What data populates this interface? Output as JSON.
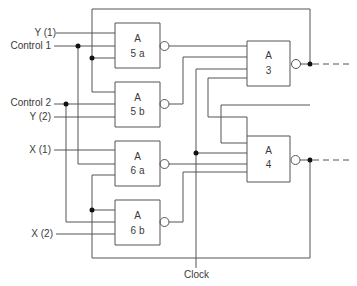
{
  "inputs": {
    "y1": "Y (1)",
    "control1": "Control 1",
    "control2": "Control 2",
    "y2": "Y (2)",
    "x1": "X (1)",
    "x2": "X (2)",
    "clock": "Clock"
  },
  "gates": {
    "g5a": {
      "type": "A",
      "id": "5 a"
    },
    "g5b": {
      "type": "A",
      "id": "5 b"
    },
    "g6a": {
      "type": "A",
      "id": "6 a"
    },
    "g6b": {
      "type": "A",
      "id": "6 b"
    },
    "g3": {
      "type": "A",
      "id": "3"
    },
    "g4": {
      "type": "A",
      "id": "4"
    }
  },
  "colors": {
    "line": "#555555",
    "text": "#3a3a3a",
    "dot": "#111111"
  }
}
